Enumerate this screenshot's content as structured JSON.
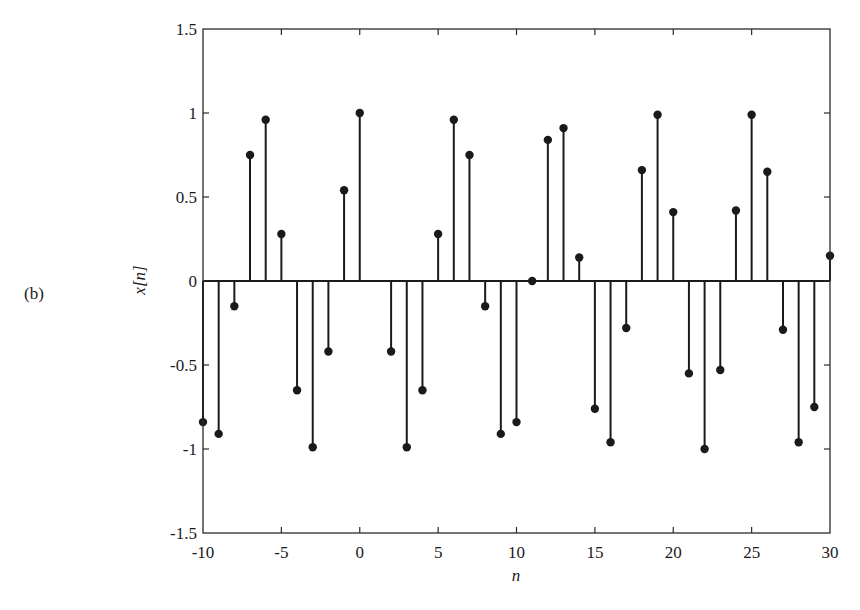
{
  "figure": {
    "panel_label": "(b)",
    "ylabel_text": "x[n]",
    "xlabel_text": "n"
  },
  "colors": {
    "stem": "#1a1a1a",
    "axis": "#2a2a2a",
    "background": "#ffffff"
  },
  "chart_data": {
    "type": "stem",
    "title": "",
    "xlabel": "n",
    "ylabel": "x[n]",
    "xlim": [
      -10,
      30
    ],
    "ylim": [
      -1.5,
      1.5
    ],
    "xticks": [
      -10,
      -5,
      0,
      5,
      10,
      15,
      20,
      25,
      30
    ],
    "xtick_labels": [
      "-10",
      "-5",
      "0",
      "5",
      "10",
      "15",
      "20",
      "25",
      "30"
    ],
    "yticks": [
      -1.5,
      -1,
      -0.5,
      0,
      0.5,
      1,
      1.5
    ],
    "ytick_labels": [
      "-1.5",
      "-1",
      "-0.5",
      "0",
      "0.5",
      "1",
      "1.5"
    ],
    "grid": false,
    "legend": null,
    "annotations": [
      "(b)"
    ],
    "x": [
      -10,
      -9,
      -8,
      -7,
      -6,
      -5,
      -4,
      -3,
      -2,
      -1,
      0,
      1,
      2,
      3,
      4,
      5,
      6,
      7,
      8,
      9,
      10,
      11,
      12,
      13,
      14,
      15,
      16,
      17,
      18,
      19,
      20,
      21,
      22,
      23,
      24,
      25,
      26,
      27,
      28,
      29,
      30
    ],
    "values": [
      -0.84,
      -0.91,
      -0.15,
      0.75,
      0.96,
      0.28,
      -0.65,
      -0.99,
      -0.42,
      0.54,
      1.0,
      0.54,
      -0.42,
      -0.99,
      -0.65,
      0.28,
      0.96,
      0.75,
      -0.15,
      -0.91,
      -0.84,
      0.0,
      0.84,
      0.91,
      0.14,
      -0.76,
      -0.96,
      -0.28,
      0.66,
      0.99,
      0.41,
      -0.55,
      -1.0,
      -0.53,
      0.42,
      0.99,
      0.65,
      -0.29,
      -0.96,
      -0.75,
      0.15
    ],
    "hidden_marker_indices": [
      11
    ]
  }
}
